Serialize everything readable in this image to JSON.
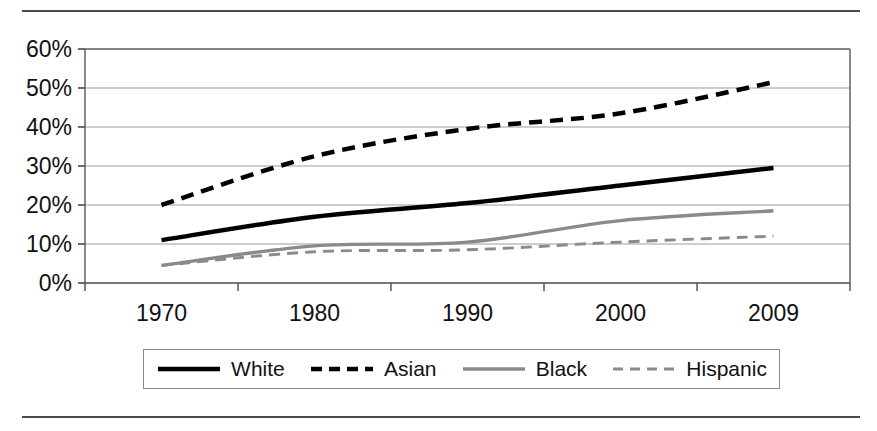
{
  "figure": {
    "top_rule": "horizontal-rule",
    "bottom_rule": "horizontal-rule"
  },
  "legend": {
    "position": "below-axes",
    "items": [
      {
        "label": "White",
        "style": "solid",
        "color": "#000000",
        "width": 4.5
      },
      {
        "label": "Asian",
        "style": "dashed",
        "color": "#000000",
        "width": 4.5
      },
      {
        "label": "Black",
        "style": "solid",
        "color": "#8a8a8a",
        "width": 3.5
      },
      {
        "label": "Hispanic",
        "style": "dashed",
        "color": "#8a8a8a",
        "width": 3.0
      }
    ]
  },
  "chart_data": {
    "type": "line",
    "title": "",
    "subtitle": "",
    "xlabel": "",
    "ylabel": "",
    "categories": [
      "1970",
      "1980",
      "1990",
      "2000",
      "2009"
    ],
    "x_tick_labels": [
      "1970",
      "1980",
      "1990",
      "2000",
      "2009"
    ],
    "y_tick_labels": [
      "0%",
      "10%",
      "20%",
      "30%",
      "40%",
      "50%",
      "60%"
    ],
    "y_ticks": [
      0,
      10,
      20,
      30,
      40,
      50,
      60
    ],
    "ylim": [
      0,
      60
    ],
    "y_unit": "%",
    "grid": "horizontal",
    "legend_position": "bottom",
    "series": [
      {
        "name": "White",
        "values": [
          11.0,
          17.0,
          20.5,
          25.0,
          29.5
        ],
        "style": "solid",
        "color": "#000000"
      },
      {
        "name": "Asian",
        "values": [
          20.0,
          32.5,
          39.5,
          43.5,
          51.5
        ],
        "style": "dashed",
        "color": "#000000"
      },
      {
        "name": "Black",
        "values": [
          4.5,
          9.5,
          10.5,
          16.0,
          18.5
        ],
        "style": "solid",
        "color": "#8a8a8a"
      },
      {
        "name": "Hispanic",
        "values": [
          4.5,
          8.0,
          8.5,
          10.5,
          12.0
        ],
        "style": "dashed",
        "color": "#8a8a8a"
      }
    ]
  }
}
